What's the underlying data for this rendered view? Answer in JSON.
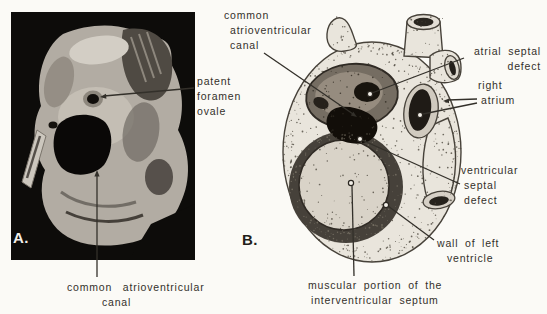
{
  "colors": {
    "page_background": "#fbfaf6",
    "ink": "#33302a",
    "photo_background": "#0d0c0a",
    "tissue_gray": "#b2aca3",
    "illustration_body": "#e9e5dc",
    "panel_a_letter_color": "#f2efe9",
    "panel_b_letter_color": "#221e19"
  },
  "panel_a": {
    "letter": "A.",
    "annotations": {
      "patent_foramen_ovale": {
        "lines": [
          "patent",
          "foramen",
          "ovale"
        ]
      },
      "common_atrioventricular_canal": {
        "lines": [
          "common atrioventricular",
          "canal"
        ]
      }
    }
  },
  "panel_b": {
    "letter": "B.",
    "annotations": {
      "common_atrioventricular_canal": {
        "lines": [
          "common",
          "atrioventricular",
          "canal"
        ]
      },
      "atrial_septal_defect": {
        "lines": [
          "atrial septal",
          "defect"
        ]
      },
      "right_atrium": {
        "lines": [
          "right",
          "atrium"
        ]
      },
      "ventricular_septal_defect": {
        "lines": [
          "ventricular",
          "septal",
          "defect"
        ]
      },
      "wall_of_left_ventricle": {
        "lines": [
          "wall of left",
          "ventricle"
        ]
      },
      "muscular_portion_of_interventricular_septum": {
        "lines": [
          "muscular portion of the",
          "interventricular septum"
        ]
      }
    }
  }
}
